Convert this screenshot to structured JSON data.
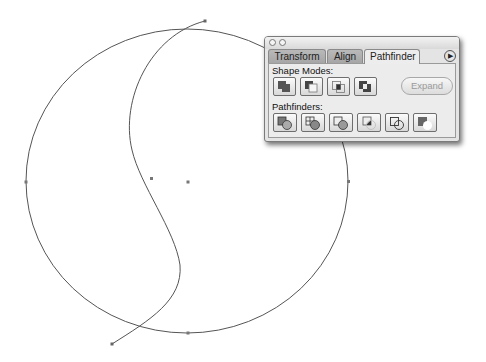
{
  "panel": {
    "tabs": [
      {
        "label": "Transform",
        "active": false
      },
      {
        "label": "Align",
        "active": false
      },
      {
        "label": "Pathfinder",
        "active": true
      }
    ],
    "menu_icon": "triangle-right-icon",
    "shape_modes": {
      "label": "Shape Modes:",
      "buttons": [
        {
          "name": "add-to-shape-area",
          "icon": "add-icon"
        },
        {
          "name": "subtract-from-shape-area",
          "icon": "subtract-icon"
        },
        {
          "name": "intersect-shape-areas",
          "icon": "intersect-icon"
        },
        {
          "name": "exclude-overlapping-shape-areas",
          "icon": "exclude-icon"
        }
      ],
      "expand_label": "Expand"
    },
    "pathfinders": {
      "label": "Pathfinders:",
      "buttons": [
        {
          "name": "divide",
          "icon": "divide-icon"
        },
        {
          "name": "trim",
          "icon": "trim-icon"
        },
        {
          "name": "merge",
          "icon": "merge-icon"
        },
        {
          "name": "crop",
          "icon": "crop-icon"
        },
        {
          "name": "outline",
          "icon": "outline-icon"
        },
        {
          "name": "minus-back",
          "icon": "minus-back-icon"
        }
      ]
    }
  },
  "canvas": {
    "circle": {
      "cx": 187,
      "cy": 181,
      "rx": 161,
      "ry": 152,
      "stroke": "#555555"
    },
    "s_curve_anchors": [
      [
        205,
        21
      ],
      [
        151,
        178
      ],
      [
        112,
        344
      ]
    ],
    "center_point": [
      188,
      182
    ],
    "circle_anchors": [
      [
        26,
        182
      ],
      [
        348,
        182
      ],
      [
        188,
        333
      ]
    ]
  }
}
